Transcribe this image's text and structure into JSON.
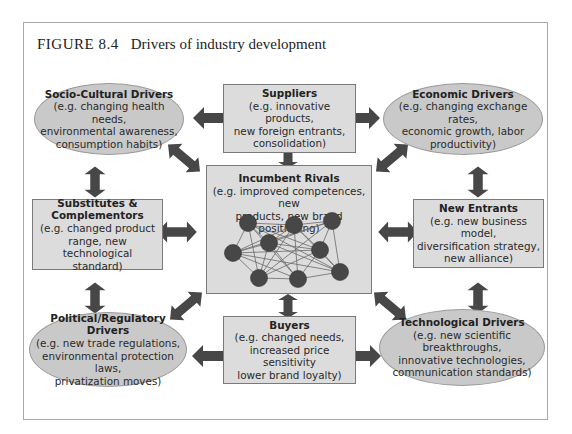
{
  "figure": {
    "number": "FIGURE 8.4",
    "title": "Drivers of industry development"
  },
  "nodes": {
    "socio_cultural": {
      "title": "Socio-Cultural Drivers",
      "lines": [
        "(e.g. changing health needs,",
        "environmental awareness,",
        "consumption habits)"
      ]
    },
    "suppliers": {
      "title": "Suppliers",
      "lines": [
        "(e.g. innovative products,",
        "new foreign entrants,",
        "consolidation)"
      ]
    },
    "economic": {
      "title": "Economic Drivers",
      "lines": [
        "(e.g. changing exchange rates,",
        "economic growth, labor",
        "productivity)"
      ]
    },
    "substitutes": {
      "title": "Substitutes &",
      "title2": "Complementors",
      "lines": [
        "(e.g. changed product",
        "range, new technological",
        "standard)"
      ]
    },
    "incumbent_rivals": {
      "title": "Incumbent Rivals",
      "lines": [
        "(e.g. improved competences, new",
        "products, new brand positioning)"
      ]
    },
    "new_entrants": {
      "title": "New Entrants",
      "lines": [
        "(e.g. new business model,",
        "diversification strategy,",
        "new alliance)"
      ]
    },
    "political": {
      "title": "Political/Regulatory Drivers",
      "lines": [
        "(e.g. new trade regulations,",
        "environmental protection laws,",
        "privatization moves)"
      ]
    },
    "buyers": {
      "title": "Buyers",
      "lines": [
        "(e.g. changed needs,",
        "increased price sensitivity",
        "lower brand loyalty)"
      ]
    },
    "technological": {
      "title": "Technological Drivers",
      "lines": [
        "(e.g. new scientific breakthroughs,",
        "innovative technologies,",
        "communication standards)"
      ]
    }
  },
  "colors": {
    "box_fill": "#dcdcdc",
    "ellipse_fill": "#c9c9c9",
    "arrow": "#474747",
    "rival_node": "#474747"
  }
}
